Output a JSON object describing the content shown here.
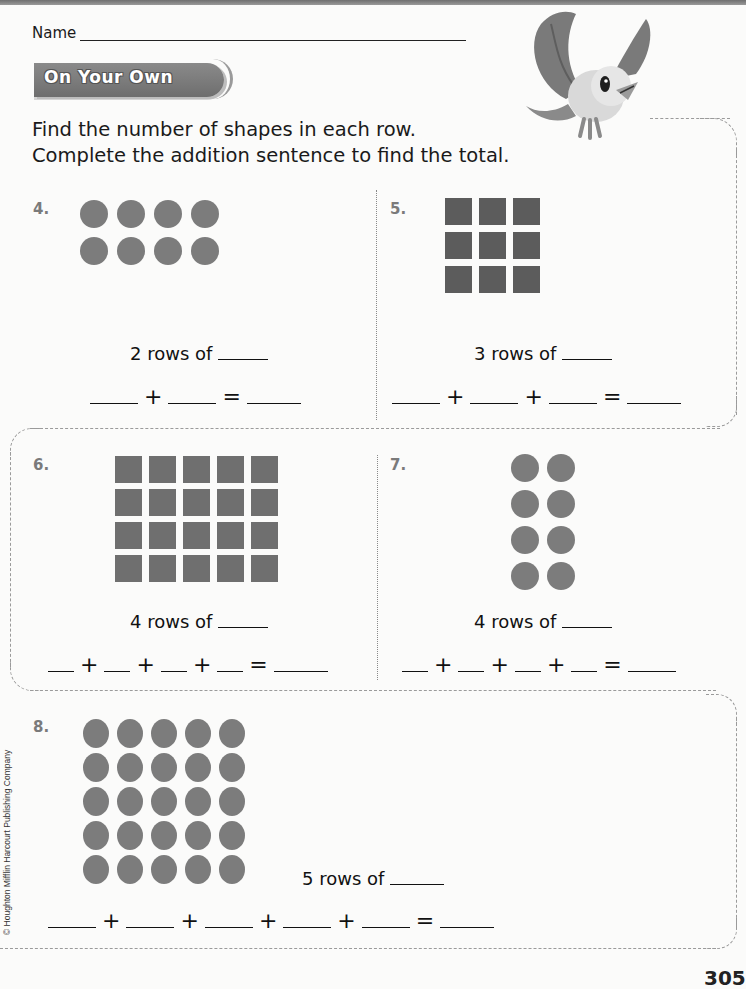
{
  "header": {
    "name_label": "Name",
    "section_title": "On Your Own",
    "instructions": [
      "Find the number of shapes in each row.",
      "Complete the addition sentence to find the total."
    ]
  },
  "problems": [
    {
      "number": "4.",
      "shape": "circle",
      "rows": 2,
      "cols": 4,
      "rows_text": "2 rows of",
      "addends": 2,
      "equation_ops": [
        "+",
        "="
      ]
    },
    {
      "number": "5.",
      "shape": "square",
      "rows": 3,
      "cols": 3,
      "rows_text": "3 rows of",
      "addends": 3,
      "equation_ops": [
        "+",
        "+",
        "="
      ]
    },
    {
      "number": "6.",
      "shape": "square",
      "rows": 4,
      "cols": 5,
      "rows_text": "4 rows of",
      "addends": 4,
      "equation_ops": [
        "+",
        "+",
        "+",
        "="
      ]
    },
    {
      "number": "7.",
      "shape": "circle",
      "rows": 4,
      "cols": 2,
      "rows_text": "4 rows of",
      "addends": 4,
      "equation_ops": [
        "+",
        "+",
        "+",
        "="
      ]
    },
    {
      "number": "8.",
      "shape": "circle",
      "rows": 5,
      "cols": 5,
      "rows_text": "5 rows of",
      "addends": 5,
      "equation_ops": [
        "+",
        "+",
        "+",
        "+",
        "="
      ]
    }
  ],
  "footer": {
    "copyright": "© Houghton Mifflin Harcourt Publishing Company",
    "page_number": "305"
  },
  "colors": {
    "circle": "#7c7c7c",
    "square_dark": "#5c5c5c",
    "square_mid": "#6f6f6f",
    "banner": "#7a7a7a"
  }
}
